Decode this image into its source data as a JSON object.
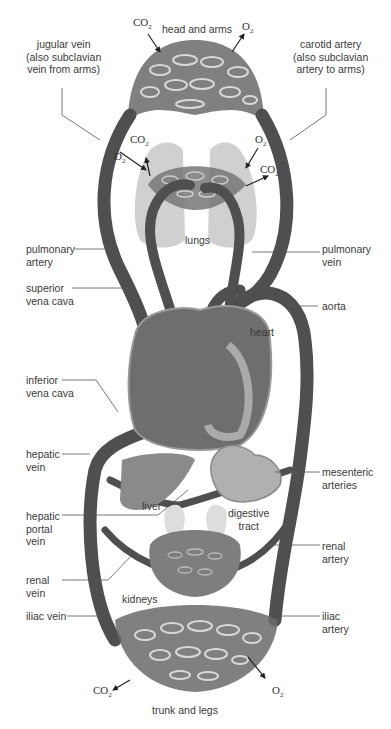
{
  "labels": {
    "head_and_arms": "head and arms",
    "jugular_vein": "jugular vein\n(also subclavian\nvein from arms)",
    "carotid_artery": "carotid artery\n(also subclavian\nartery to arms)",
    "lungs": "lungs",
    "pulmonary_artery": "pulmonary\nartery",
    "pulmonary_vein": "pulmonary\nvein",
    "superior_vena_cava": "superior\nvena cava",
    "aorta": "aorta",
    "heart": "heart",
    "inferior_vena_cava": "inferior\nvena cava",
    "hepatic_vein": "hepatic\nvein",
    "mesenteric_arteries": "mesenteric\narteries",
    "liver": "liver",
    "digestive_tract": "digestive\ntract",
    "hepatic_portal_vein": "hepatic\nportal\nvein",
    "renal_artery": "renal\nartery",
    "renal_vein": "renal\nvein",
    "kidneys": "kidneys",
    "iliac_vein": "iliac vein",
    "iliac_artery": "iliac\nartery",
    "trunk_and_legs": "trunk and legs"
  },
  "gases": {
    "co2_base": "CO",
    "co2_sub": "2",
    "o2_base": "O",
    "o2_sub": "2"
  },
  "colors": {
    "vessel": "#5a5a5a",
    "vessel_dark": "#3e3e3e",
    "organ": "#8a8a8a",
    "lung": "#c4c4c4",
    "leader": "#555555"
  }
}
